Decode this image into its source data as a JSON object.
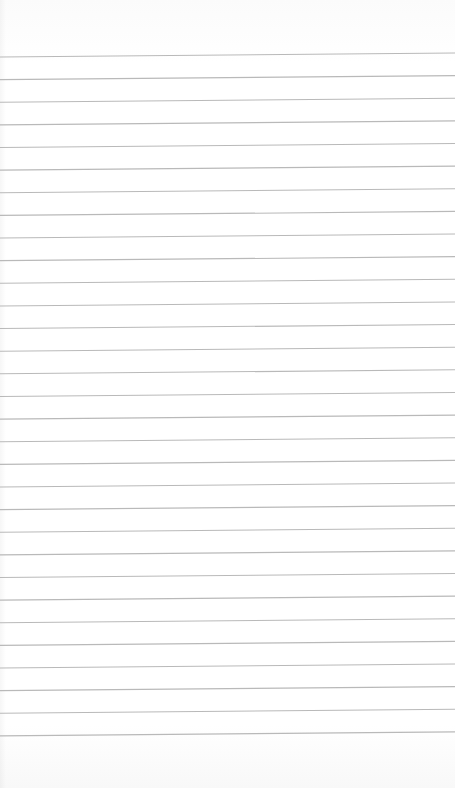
{
  "page": {
    "type": "lined-paper",
    "background_color": "#fdfdfd",
    "line_color": "#b9b9b9",
    "line_count": 31,
    "first_line_y_left": 57,
    "first_line_y_right": 53,
    "line_spacing": 22.63,
    "text": ""
  }
}
